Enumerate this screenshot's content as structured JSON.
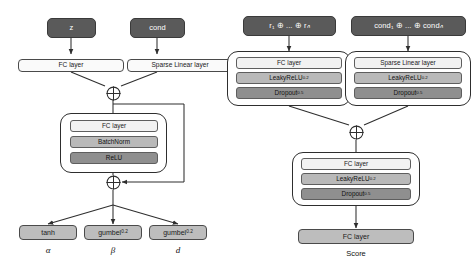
{
  "figure": {
    "background_color": "#ffffff",
    "line_color": "#2e2e2e",
    "pill_color": "#5a5a5a",
    "light_bar_color": "#f2f2f2",
    "mid_bar_color": "#b9b9b9",
    "dark_bar_color": "#8f8f8f"
  },
  "generator": {
    "inputs": {
      "latent": "z",
      "condition": "cond"
    },
    "projection": {
      "latent_layer": "FC layer",
      "condition_layer": "Sparse Linear layer"
    },
    "merge_icon": "circled-plus-icon",
    "residual_block": {
      "layers": [
        {
          "label": "FC layer",
          "shade": "light"
        },
        {
          "label": "BatchNorm",
          "shade": "mid"
        },
        {
          "label": "ReLU",
          "shade": "dark"
        }
      ]
    },
    "outputs": [
      {
        "activation": "tanh",
        "subscript": "",
        "symbol": "α"
      },
      {
        "activation": "gumbel",
        "subscript": "0.2",
        "symbol": "β"
      },
      {
        "activation": "gumbel",
        "subscript": "0.2",
        "symbol": "d"
      }
    ]
  },
  "discriminator": {
    "inputs": {
      "rows": "r₁ ⊕ ... ⊕ rₙ",
      "conds": "cond₁ ⊕ ... ⊕ condₙ"
    },
    "left_block": {
      "layers": [
        {
          "label": "FC layer",
          "subscript": "",
          "shade": "light"
        },
        {
          "label": "LeakyReLU",
          "subscript": "0.2",
          "shade": "mid"
        },
        {
          "label": "Dropout",
          "subscript": "0.5",
          "shade": "dark"
        }
      ]
    },
    "right_block": {
      "layers": [
        {
          "label": "Sparse Linear layer",
          "subscript": "",
          "shade": "light"
        },
        {
          "label": "LeakyReLU",
          "subscript": "0.2",
          "shade": "mid"
        },
        {
          "label": "Dropout",
          "subscript": "0.5",
          "shade": "dark"
        }
      ]
    },
    "merge_icon": "circled-plus-icon",
    "head_block": {
      "layers": [
        {
          "label": "FC layer",
          "subscript": "",
          "shade": "light"
        },
        {
          "label": "LeakyReLU",
          "subscript": "0.2",
          "shade": "mid"
        },
        {
          "label": "Dropout",
          "subscript": "0.5",
          "shade": "dark"
        }
      ]
    },
    "output_layer": "FC layer",
    "output_caption": "Score"
  }
}
